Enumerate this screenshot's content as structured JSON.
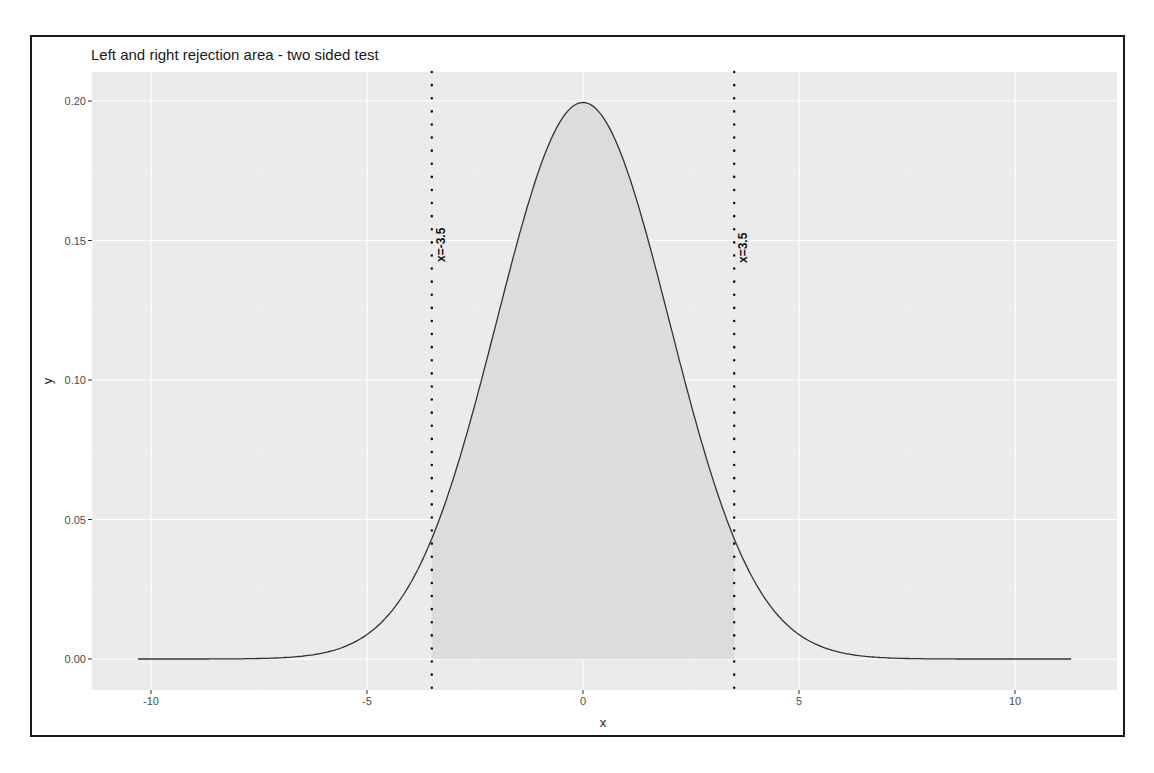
{
  "chart_data": {
    "type": "area",
    "title": "Left and right rejection area - two sided test",
    "xlabel": "x",
    "ylabel": "y",
    "xlim": [
      -11.1,
      12.5
    ],
    "ylim": [
      -0.011,
      0.21
    ],
    "x_ticks": [
      -10,
      -5,
      0,
      5,
      10
    ],
    "x_tick_labels": [
      "-10",
      "-5",
      "0",
      "5",
      "10"
    ],
    "y_ticks": [
      0.0,
      0.05,
      0.1,
      0.15,
      0.2
    ],
    "y_tick_labels": [
      "0.00",
      "0.05",
      "0.10",
      "0.15",
      "0.20"
    ],
    "grid": true,
    "legend": "none",
    "series": [
      {
        "name": "density",
        "distribution": "normal",
        "mean": 0,
        "sd": 2,
        "x_range": [
          -10.3,
          11.3
        ],
        "peak": 0.199,
        "x": [
          -10,
          -8,
          -6,
          -5,
          -4,
          -3.5,
          -3,
          -2,
          -1,
          0,
          1,
          2,
          3,
          3.5,
          4,
          5,
          6,
          8,
          10
        ],
        "values": [
          0.0,
          0.0001,
          0.0022,
          0.0088,
          0.027,
          0.0431,
          0.0648,
          0.121,
          0.176,
          0.1995,
          0.176,
          0.121,
          0.0648,
          0.0431,
          0.027,
          0.0088,
          0.0022,
          0.0001,
          0.0
        ]
      }
    ],
    "shaded_region": {
      "from": -3.5,
      "to": 3.5,
      "label": "acceptance area under curve"
    },
    "annotations": [
      {
        "type": "vline",
        "x": -3.5,
        "style": "dotted",
        "label": "x=-3.5"
      },
      {
        "type": "vline",
        "x": 3.5,
        "style": "dotted",
        "label": "x=3.5"
      }
    ],
    "colors": {
      "panel_bg": "#ebebeb",
      "grid": "#ffffff",
      "shade": "#d9d9d9",
      "line": "#333333"
    }
  }
}
